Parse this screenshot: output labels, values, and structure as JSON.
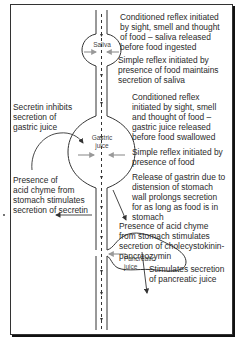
{
  "diagram": {
    "organs": {
      "saliva": "Saliva",
      "gastric": "Gastric\njuice",
      "pancreatic": "Pancreatic\njuice"
    },
    "annotations": {
      "saliva_conditioned": "Conditioned reflex initiated\nby sight, smell and thought\nof food – saliva released\nbefore food ingested",
      "saliva_simple": "Simple reflex initiated by\npresence of food maintains\nsecretion of saliva",
      "gastric_conditioned": "Conditioned reflex\ninitiated by sight, smell\nand thought of food –\ngastric juice released\nbefore food swallowed",
      "gastric_simple": "Simple reflex initiated by\npresence of food",
      "gastrin": "Release of gastrin due to\ndistension of stomach\nwall prolongs secretion\nfor as long as food is in\nstomach",
      "secretin_inhibits": "Secretin inhibits\nsecretion of\ngastric juice",
      "secretin_stimulated": "Presence of\nacid chyme from\nstomach stimulates\nsecretion of secretin",
      "cck": "Presence of acid chyme\nfrom stomach stimulates\nsecretion of cholecystokinin-\npancreozymin",
      "pancreatic_stimulates": "Stimulates secretion\nof pancreatic juice"
    },
    "colors": {
      "line": "#333333",
      "secretion_arrow": "#999999",
      "frame_shadow": "#111111"
    }
  }
}
